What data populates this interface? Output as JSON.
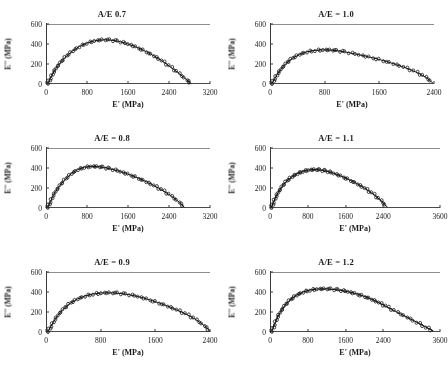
{
  "figure": {
    "panel_count": 6,
    "shared_ylabel": "E'' (MPa)",
    "shared_xlabel": "E' (MPa)",
    "yticks": [
      0,
      200,
      400,
      600
    ],
    "ymin": 0,
    "ymax": 600
  },
  "chart_data": [
    {
      "type": "scatter",
      "title": "A/E 0.7",
      "xlabel": "E' (MPa)",
      "ylabel": "E'' (MPa)",
      "xlim": [
        0,
        3200
      ],
      "ylim": [
        0,
        600
      ],
      "xticks": [
        0,
        800,
        1600,
        2400,
        3200
      ],
      "xtick_labels": [
        "0",
        "800",
        "1600",
        "2400",
        "3200"
      ],
      "yticks": [
        0,
        200,
        400,
        600
      ],
      "ytick_labels": [
        "0",
        "200",
        "400",
        "600"
      ],
      "grid": false,
      "legend": "none",
      "series": [
        {
          "name": "Cole-Cole arc",
          "x": [
            40,
            90,
            150,
            220,
            300,
            400,
            520,
            650,
            800,
            950,
            1100,
            1250,
            1400,
            1550,
            1700,
            1850,
            2000,
            2150,
            2300,
            2450,
            2600,
            2750,
            2830
          ],
          "y": [
            10,
            60,
            120,
            175,
            225,
            280,
            330,
            375,
            410,
            432,
            442,
            440,
            428,
            408,
            382,
            350,
            312,
            268,
            218,
            163,
            104,
            40,
            5
          ]
        }
      ],
      "peak": {
        "x": 1100,
        "y": 442
      },
      "x_intercept": 2830
    },
    {
      "type": "scatter",
      "title": "A/E = 1.0",
      "xlabel": "E' (MPa)",
      "ylabel": "E'' (MPa)",
      "xlim": [
        0,
        2400
      ],
      "ylim": [
        0,
        600
      ],
      "xticks": [
        0,
        800,
        1600,
        2400
      ],
      "xtick_labels": [
        "0",
        "800",
        "1600",
        "2400"
      ],
      "yticks": [
        0,
        200,
        400,
        600
      ],
      "ytick_labels": [
        "0",
        "200",
        "400",
        "600"
      ],
      "grid": false,
      "legend": "none",
      "series": [
        {
          "name": "Cole-Cole arc",
          "x": [
            30,
            70,
            120,
            180,
            250,
            330,
            430,
            540,
            660,
            780,
            880,
            980,
            1100,
            1250,
            1400,
            1550,
            1700,
            1850,
            2000,
            2150,
            2280,
            2380
          ],
          "y": [
            8,
            55,
            110,
            165,
            215,
            258,
            295,
            322,
            336,
            342,
            340,
            333,
            320,
            300,
            278,
            254,
            226,
            194,
            158,
            115,
            68,
            12
          ]
        }
      ],
      "peak": {
        "x": 820,
        "y": 342
      },
      "x_intercept": 2400
    },
    {
      "type": "scatter",
      "title": "A/E = 0.8",
      "xlabel": "E' (MPa)",
      "ylabel": "E'' (MPa)",
      "xlim": [
        0,
        3200
      ],
      "ylim": [
        0,
        600
      ],
      "xticks": [
        0,
        800,
        1600,
        2400,
        3200
      ],
      "xtick_labels": [
        "0",
        "800",
        "1600",
        "2400",
        "3200"
      ],
      "yticks": [
        0,
        200,
        400,
        600
      ],
      "ytick_labels": [
        "0",
        "200",
        "400",
        "600"
      ],
      "grid": false,
      "legend": "none",
      "series": [
        {
          "name": "Cole-Cole arc",
          "x": [
            35,
            85,
            140,
            210,
            290,
            385,
            495,
            620,
            750,
            880,
            1000,
            1120,
            1250,
            1400,
            1550,
            1700,
            1850,
            2000,
            2150,
            2300,
            2450,
            2600,
            2700
          ],
          "y": [
            10,
            62,
            125,
            182,
            238,
            292,
            343,
            385,
            408,
            416,
            414,
            406,
            392,
            372,
            348,
            320,
            288,
            252,
            212,
            168,
            118,
            58,
            8
          ]
        }
      ],
      "peak": {
        "x": 880,
        "y": 416
      },
      "x_intercept": 2700
    },
    {
      "type": "scatter",
      "title": "A/E = 1.1",
      "xlabel": "E' (MPa)",
      "ylabel": "E'' (MPa)",
      "xlim": [
        0,
        3600
      ],
      "ylim": [
        0,
        600
      ],
      "xticks": [
        0,
        800,
        1600,
        2400,
        3600
      ],
      "xtick_labels": [
        "0",
        "800",
        "1600",
        "2400",
        "3600"
      ],
      "yticks": [
        0,
        200,
        400,
        600
      ],
      "ytick_labels": [
        "0",
        "200",
        "400",
        "600"
      ],
      "grid": false,
      "legend": "none",
      "series": [
        {
          "name": "Cole-Cole arc",
          "x": [
            30,
            75,
            130,
            195,
            270,
            360,
            465,
            580,
            700,
            820,
            940,
            1060,
            1180,
            1300,
            1450,
            1600,
            1750,
            1900,
            2050,
            2200,
            2350,
            2480
          ],
          "y": [
            8,
            58,
            118,
            172,
            225,
            272,
            312,
            345,
            368,
            380,
            384,
            380,
            370,
            354,
            330,
            300,
            266,
            228,
            184,
            134,
            74,
            10
          ]
        }
      ],
      "peak": {
        "x": 940,
        "y": 384
      },
      "x_intercept": 2480
    },
    {
      "type": "scatter",
      "title": "A/E = 0.9",
      "xlabel": "E' (MPa)",
      "ylabel": "E'' (MPa)",
      "xlim": [
        0,
        2400
      ],
      "ylim": [
        0,
        600
      ],
      "xticks": [
        0,
        800,
        1600,
        2400
      ],
      "xtick_labels": [
        "0",
        "800",
        "1600",
        "2400"
      ],
      "yticks": [
        0,
        200,
        400,
        600
      ],
      "ytick_labels": [
        "0",
        "200",
        "400",
        "600"
      ],
      "grid": false,
      "legend": "none",
      "series": [
        {
          "name": "Cole-Cole arc",
          "x": [
            30,
            75,
            130,
            195,
            270,
            360,
            460,
            570,
            690,
            810,
            930,
            1050,
            1170,
            1300,
            1430,
            1560,
            1690,
            1820,
            1950,
            2080,
            2200,
            2320,
            2400
          ],
          "y": [
            8,
            60,
            125,
            185,
            240,
            290,
            330,
            360,
            380,
            390,
            392,
            388,
            378,
            362,
            340,
            312,
            282,
            248,
            210,
            168,
            122,
            62,
            8
          ]
        }
      ],
      "peak": {
        "x": 930,
        "y": 392
      },
      "x_intercept": 2400
    },
    {
      "type": "scatter",
      "title": "A/E = 1.2",
      "xlabel": "E' (MPa)",
      "ylabel": "E'' (MPa)",
      "xlim": [
        0,
        3600
      ],
      "ylim": [
        0,
        600
      ],
      "xticks": [
        0,
        800,
        1600,
        2400,
        3600
      ],
      "xtick_labels": [
        "0",
        "800",
        "1600",
        "2400",
        "3600"
      ],
      "yticks": [
        0,
        200,
        400,
        600
      ],
      "ytick_labels": [
        "0",
        "200",
        "400",
        "600"
      ],
      "grid": false,
      "legend": "none",
      "series": [
        {
          "name": "Cole-Cole arc",
          "x": [
            40,
            95,
            160,
            240,
            330,
            440,
            560,
            700,
            850,
            1000,
            1150,
            1300,
            1450,
            1600,
            1750,
            1900,
            2050,
            2200,
            2350,
            2500,
            2700,
            2900,
            3100,
            3300,
            3450
          ],
          "y": [
            10,
            75,
            150,
            215,
            275,
            325,
            368,
            400,
            420,
            430,
            432,
            428,
            420,
            408,
            392,
            372,
            348,
            318,
            282,
            245,
            196,
            148,
            100,
            50,
            12
          ]
        }
      ],
      "peak": {
        "x": 1150,
        "y": 432
      },
      "x_intercept": 3450
    }
  ]
}
